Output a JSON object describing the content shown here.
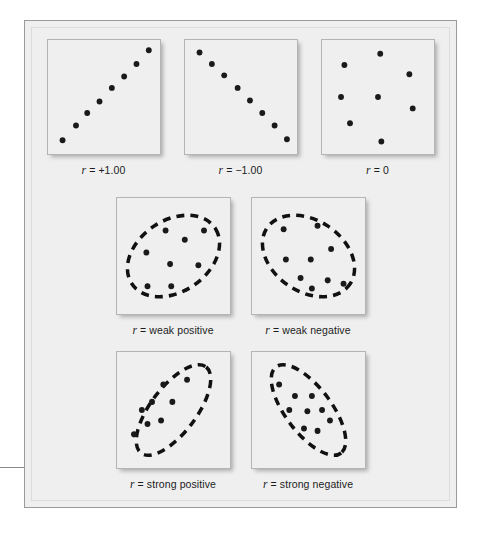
{
  "figure": {
    "background_color": "#efefef",
    "frame_border_color": "#9a9a9a",
    "dot_color": "#1a1a1a",
    "ellipse_color": "#111111"
  },
  "chart_data": {
    "type": "scatter",
    "title": "",
    "xlabel": "",
    "ylabel": "",
    "xlim": [
      0,
      100
    ],
    "ylim": [
      0,
      100
    ],
    "grid": false,
    "legend": "none",
    "panels": [
      {
        "id": "perfect-positive",
        "r_symbol": "r",
        "equals": "=",
        "value": "+1.00",
        "caption": "r = +1.00",
        "envelope": null,
        "points": [
          [
            13,
            12
          ],
          [
            25,
            25
          ],
          [
            35,
            36
          ],
          [
            46,
            46
          ],
          [
            57,
            58
          ],
          [
            68,
            68
          ],
          [
            79,
            79
          ],
          [
            90,
            91
          ]
        ]
      },
      {
        "id": "perfect-negative",
        "r_symbol": "r",
        "equals": "=",
        "value": "−1.00",
        "caption": "r = −1.00",
        "envelope": null,
        "points": [
          [
            13,
            89
          ],
          [
            24,
            79
          ],
          [
            35,
            69
          ],
          [
            47,
            58
          ],
          [
            58,
            47
          ],
          [
            69,
            36
          ],
          [
            80,
            25
          ],
          [
            91,
            13
          ]
        ]
      },
      {
        "id": "zero",
        "r_symbol": "r",
        "equals": "=",
        "value": "0",
        "caption": "r = 0",
        "envelope": null,
        "points": [
          [
            20,
            78
          ],
          [
            52,
            88
          ],
          [
            78,
            70
          ],
          [
            17,
            50
          ],
          [
            50,
            50
          ],
          [
            81,
            40
          ],
          [
            25,
            27
          ],
          [
            53,
            11
          ]
        ]
      },
      {
        "id": "weak-positive",
        "r_symbol": "r",
        "equals": "=",
        "value": "weak positive",
        "caption": "r = weak positive",
        "envelope": {
          "shape": "ellipse",
          "orientation": "positive",
          "rotation_deg": -32,
          "rx": 44,
          "ry": 31
        },
        "points": [
          [
            43,
            72
          ],
          [
            60,
            64
          ],
          [
            77,
            72
          ],
          [
            26,
            53
          ],
          [
            47,
            43
          ],
          [
            72,
            42
          ],
          [
            27,
            24
          ],
          [
            48,
            24
          ]
        ]
      },
      {
        "id": "weak-negative",
        "r_symbol": "r",
        "equals": "=",
        "value": "weak negative",
        "caption": "r = weak negative",
        "envelope": {
          "shape": "ellipse",
          "orientation": "negative",
          "rotation_deg": 32,
          "rx": 44,
          "ry": 31
        },
        "points": [
          [
            28,
            73
          ],
          [
            58,
            76
          ],
          [
            70,
            56
          ],
          [
            30,
            47
          ],
          [
            52,
            47
          ],
          [
            67,
            29
          ],
          [
            81,
            26
          ],
          [
            53,
            22
          ],
          [
            43,
            31
          ]
        ]
      },
      {
        "id": "strong-positive",
        "r_symbol": "r",
        "equals": "=",
        "value": "strong positive",
        "caption": "r = strong positive",
        "envelope": {
          "shape": "ellipse",
          "orientation": "positive",
          "rotation_deg": -52,
          "rx": 47,
          "ry": 20
        },
        "points": [
          [
            62,
            76
          ],
          [
            41,
            72
          ],
          [
            49,
            57
          ],
          [
            31,
            57
          ],
          [
            22,
            50
          ],
          [
            39,
            41
          ],
          [
            27,
            38
          ],
          [
            15,
            29
          ]
        ]
      },
      {
        "id": "strong-negative",
        "r_symbol": "r",
        "equals": "=",
        "value": "strong negative",
        "caption": "r = strong negative",
        "envelope": {
          "shape": "ellipse",
          "orientation": "negative",
          "rotation_deg": 52,
          "rx": 47,
          "ry": 20
        },
        "points": [
          [
            24,
            72
          ],
          [
            38,
            62
          ],
          [
            53,
            62
          ],
          [
            33,
            50
          ],
          [
            49,
            49
          ],
          [
            62,
            50
          ],
          [
            46,
            34
          ],
          [
            58,
            32
          ],
          [
            69,
            41
          ]
        ]
      }
    ]
  }
}
